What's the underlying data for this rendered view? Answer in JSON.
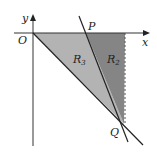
{
  "diagram": {
    "type": "coordinate-regions",
    "axes": {
      "x_label": "x",
      "y_label": "y",
      "origin_label": "O"
    },
    "points": {
      "P": "P",
      "Q": "Q"
    },
    "regions": [
      {
        "id": "R3",
        "label": "R",
        "subscript": "3",
        "fill": "#b3b3b3"
      },
      {
        "id": "R2",
        "label": "R",
        "subscript": "2",
        "fill": "#858585"
      }
    ],
    "colors": {
      "line": "#222222",
      "axis": "#333333",
      "dashed": "#555555",
      "background": "#ffffff"
    }
  }
}
